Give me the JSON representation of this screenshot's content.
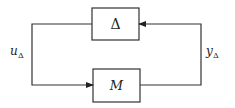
{
  "diagram": {
    "title": "",
    "blocks": [
      {
        "id": "delta",
        "label": "Δ"
      },
      {
        "id": "M",
        "label": "M"
      }
    ],
    "signals": [
      {
        "id": "u_delta",
        "base": "u",
        "sub": "Δ",
        "from": "delta",
        "to": "M"
      },
      {
        "id": "y_delta",
        "base": "y",
        "sub": "Δ",
        "from": "M",
        "to": "delta"
      }
    ],
    "colors": {
      "stroke": "#333333",
      "background": "#ffffff"
    }
  }
}
